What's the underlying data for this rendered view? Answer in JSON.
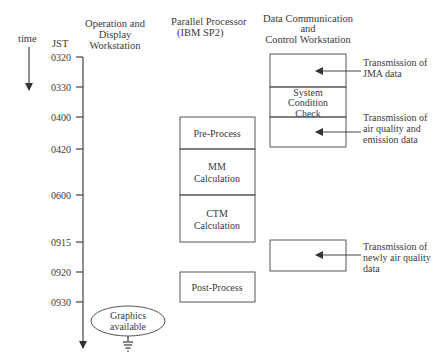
{
  "headers": {
    "time": "time",
    "jst": "JST",
    "operation": [
      "Operation and",
      "Display",
      "Workstation"
    ],
    "parallel": [
      "Parallel Processor",
      "(IBM SP2)"
    ],
    "datacomm": [
      "Data Communication",
      "and",
      "Control Workstation"
    ]
  },
  "time_ticks": [
    "0320",
    "0330",
    "0400",
    "0420",
    "0600",
    "0915",
    "0920",
    "0930"
  ],
  "parallel_processes": [
    {
      "lines": [
        "Pre-Process"
      ],
      "start": "0400",
      "end": "0420"
    },
    {
      "lines": [
        "MM",
        "Calculation"
      ],
      "start": "0420",
      "end": "0600"
    },
    {
      "lines": [
        "CTM",
        "Calculation"
      ],
      "start": "0600",
      "end": "0915"
    },
    {
      "lines": [
        "Post-Process"
      ],
      "start": "0920",
      "end": "0930"
    }
  ],
  "datacomm_blocks": [
    {
      "lines": [],
      "start": "0320",
      "end": "0330"
    },
    {
      "lines": [
        "System",
        "Condition",
        "Check"
      ],
      "start": "0330",
      "end": "0400"
    },
    {
      "lines": [],
      "start": "0400",
      "end": "0420"
    },
    {
      "lines": [],
      "start": "0915",
      "end": "0920"
    }
  ],
  "transmissions": [
    {
      "lines": [
        "Transmission of",
        "JMA data"
      ]
    },
    {
      "lines": [
        "Transmission of",
        "air quality and",
        "emission data"
      ]
    },
    {
      "lines": [
        "Transmission of",
        "newly air quality",
        "data"
      ]
    }
  ],
  "output": {
    "lines": [
      "Graphics",
      "available"
    ]
  }
}
